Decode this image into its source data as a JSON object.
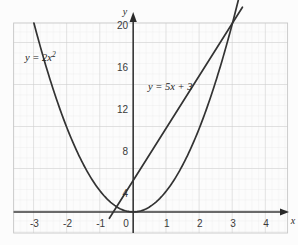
{
  "chart_data": {
    "type": "line",
    "title": "",
    "xlabel": "x",
    "ylabel": "y",
    "xlim": [
      -3.45,
      4.35
    ],
    "ylim": [
      -2.2,
      21.0
    ],
    "grid": true,
    "grid_major_step_x": 1,
    "grid_major_step_y": 4,
    "grid_minor_per_major": 5,
    "legend": "inline-annotations",
    "xticks": [
      "-3",
      "-2",
      "-1",
      "0",
      "1",
      "2",
      "3",
      "4"
    ],
    "xtick_values": [
      -3,
      -2,
      -1,
      0,
      1,
      2,
      3,
      4
    ],
    "yticks": [
      "20",
      "16",
      "12",
      "8",
      "4",
      "0"
    ],
    "ytick_values": [
      20,
      16,
      12,
      8,
      4,
      0
    ],
    "series": [
      {
        "name": "y = 2x^2",
        "label": "y = 2x",
        "label_exponent": "2",
        "equation": "y = 2x²",
        "type": "parabola",
        "color": "#333333",
        "x_start": -3.0,
        "x_end": 3.18,
        "x": [
          -3.0,
          -2.75,
          -2.5,
          -2.25,
          -2.0,
          -1.75,
          -1.5,
          -1.25,
          -1.0,
          -0.75,
          -0.5,
          -0.25,
          0,
          0.25,
          0.5,
          0.75,
          1.0,
          1.25,
          1.5,
          1.75,
          2.0,
          2.25,
          2.5,
          2.75,
          3.0,
          3.18
        ],
        "y": [
          18.0,
          15.125,
          12.5,
          10.125,
          8.0,
          6.125,
          4.5,
          3.125,
          2.0,
          1.125,
          0.5,
          0.125,
          0,
          0.125,
          0.5,
          1.125,
          2.0,
          3.125,
          4.5,
          6.125,
          8.0,
          10.125,
          12.5,
          15.125,
          18.0,
          20.2
        ]
      },
      {
        "name": "y = 5x + 3",
        "label": "y = 5x + 3",
        "equation": "y = 5x + 3",
        "type": "line",
        "color": "#333333",
        "slope": 5,
        "intercept": 3,
        "x_start": -0.72,
        "x_end": 3.3,
        "x": [
          -0.72,
          3.3
        ],
        "y": [
          -0.6,
          19.5
        ]
      }
    ],
    "intersections": [
      {
        "x": -0.5,
        "y": 0.5
      },
      {
        "x": 3.0,
        "y": 18.0
      }
    ],
    "annotations": [
      {
        "name": "parabola-label",
        "text": "y = 2x²",
        "x": -2.35,
        "y": 17.0
      },
      {
        "name": "line-label",
        "text": "y = 5x + 3",
        "x": 0.45,
        "y": 13.1
      }
    ]
  },
  "axes": {
    "y_axis_name": "y",
    "x_axis_name": "x",
    "origin_label": "0"
  },
  "colors": {
    "background": "#fcfcfc",
    "grid_minor": "#e2e2e2",
    "grid_major": "#c9c9c9",
    "axis": "#3a3a3a",
    "curve": "#333333",
    "text": "#2a2a2a"
  }
}
